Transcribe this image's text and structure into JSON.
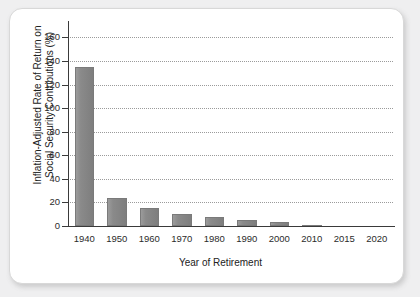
{
  "chart_data": {
    "type": "bar",
    "title": "",
    "xlabel": "Year of Retirement",
    "ylabel": "Inflation-Adjusted Rate of Return on Social Security Contributions (%)",
    "ylabel_line1": "Inflation-Adjusted Rate of Return on",
    "ylabel_line2": "Social Security Contributions (%)",
    "categories": [
      "1940",
      "1950",
      "1960",
      "1970",
      "1980",
      "1990",
      "2000",
      "2010",
      "2015",
      "2020"
    ],
    "values": [
      135,
      24,
      15,
      10,
      7.5,
      5,
      3,
      1,
      0.3,
      0
    ],
    "ylim": [
      0,
      168
    ],
    "yticks": [
      0,
      20,
      40,
      60,
      80,
      100,
      120,
      140,
      160
    ],
    "ytick_labels": [
      "0",
      "20",
      "40",
      "60",
      "80",
      "100",
      "120",
      "140",
      "160"
    ],
    "grid": "horizontal-dotted",
    "legend": "none",
    "bar_color": "#8a8a8a",
    "axis_color": "#3a3a3a",
    "grid_color": "#9b9b9b",
    "panel_background": "#ffffff",
    "page_background": "#efeff0"
  }
}
